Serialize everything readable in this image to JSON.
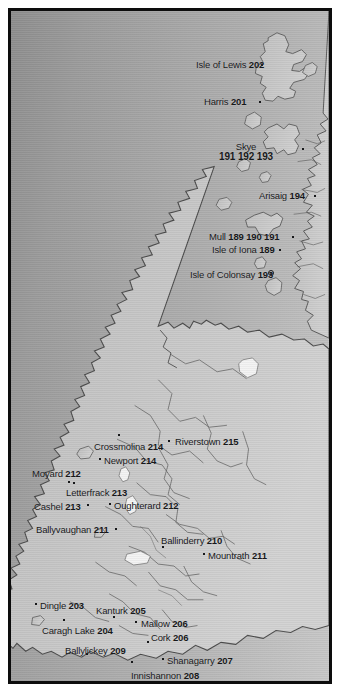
{
  "figure": {
    "kind": "reference-map",
    "region": "Ireland and western Scotland",
    "frame_color": "#0d0d0d",
    "sea_color": "#a6a6a6",
    "land_color": "#c4c4c4",
    "coast_line_color": "#4a4a4a",
    "label_color": "#17181a",
    "water_inland_color": "#f2f2f2"
  },
  "labels": [
    {
      "name": "Isle of Lewis",
      "code": "202",
      "x": 188,
      "y": 52,
      "anchor": "right",
      "marker": "dot",
      "marker_x": 254,
      "marker_y": 57
    },
    {
      "name": "Harris",
      "code": "201",
      "x": 196,
      "y": 89,
      "anchor": "right",
      "marker": "dot",
      "marker_x": 252,
      "marker_y": 94
    },
    {
      "name": "Skye",
      "code": "191 192 193",
      "x": 238,
      "y": 134,
      "anchor": "center",
      "two_line": true,
      "marker": "dot",
      "marker_x": 295,
      "marker_y": 141
    },
    {
      "name": "Arisaig",
      "code": "194",
      "x": 251,
      "y": 183,
      "anchor": "right",
      "marker": "dot",
      "marker_x": 307,
      "marker_y": 188
    },
    {
      "name": "Mull",
      "code": "189 190 191",
      "x": 201,
      "y": 224,
      "anchor": "right",
      "marker": "dot",
      "marker_x": 285,
      "marker_y": 229
    },
    {
      "name": "Isle of Iona",
      "code": "189",
      "x": 204,
      "y": 237,
      "anchor": "right",
      "marker": "dot",
      "marker_x": 272,
      "marker_y": 242
    },
    {
      "name": "Isle of Colonsay",
      "code": "193",
      "x": 182,
      "y": 262,
      "anchor": "right",
      "marker": "ring",
      "marker_x": 263,
      "marker_y": 265
    },
    {
      "name": "Crossmolina",
      "code": "214",
      "x": 86,
      "y": 434,
      "anchor": "left",
      "marker": "dot",
      "marker_x": 111,
      "marker_y": 427
    },
    {
      "name": "Riverstown",
      "code": "215",
      "x": 167,
      "y": 429,
      "anchor": "left",
      "marker": "dot",
      "marker_x": 161,
      "marker_y": 433
    },
    {
      "name": "Newport",
      "code": "214",
      "x": 96,
      "y": 448,
      "anchor": "left",
      "marker": "dot",
      "marker_x": 92,
      "marker_y": 451
    },
    {
      "name": "Moyard",
      "code": "212",
      "x": 24,
      "y": 461,
      "anchor": "left",
      "marker": "dot",
      "marker_x": 66,
      "marker_y": 475
    },
    {
      "name": "Letterfrack",
      "code": "213",
      "x": 58,
      "y": 480,
      "anchor": "left",
      "marker": "dot",
      "marker_x": 61,
      "marker_y": 474
    },
    {
      "name": "Cashel",
      "code": "213",
      "x": 26,
      "y": 494,
      "anchor": "left",
      "marker": "dot",
      "marker_x": 80,
      "marker_y": 497
    },
    {
      "name": "Oughterard",
      "code": "212",
      "x": 106,
      "y": 493,
      "anchor": "left",
      "marker": "dot",
      "marker_x": 102,
      "marker_y": 496
    },
    {
      "name": "Ballyvaughan",
      "code": "211",
      "x": 28,
      "y": 517,
      "anchor": "left",
      "marker": "dot",
      "marker_x": 108,
      "marker_y": 521
    },
    {
      "name": "Ballinderry",
      "code": "210",
      "x": 153,
      "y": 528,
      "anchor": "left",
      "marker": "dot",
      "marker_x": 155,
      "marker_y": 539
    },
    {
      "name": "Mountrath",
      "code": "211",
      "x": 200,
      "y": 543,
      "anchor": "left",
      "marker": "dot",
      "marker_x": 196,
      "marker_y": 546
    },
    {
      "name": "Dingle",
      "code": "203",
      "x": 32,
      "y": 593,
      "anchor": "left",
      "marker": "dot",
      "marker_x": 28,
      "marker_y": 596
    },
    {
      "name": "Kanturk",
      "code": "205",
      "x": 88,
      "y": 598,
      "anchor": "left",
      "marker": "dot",
      "marker_x": 106,
      "marker_y": 609
    },
    {
      "name": "Mallow",
      "code": "206",
      "x": 133,
      "y": 611,
      "anchor": "left",
      "marker": "dot",
      "marker_x": 128,
      "marker_y": 614
    },
    {
      "name": "Caragh Lake",
      "code": "204",
      "x": 34,
      "y": 618,
      "anchor": "left",
      "marker": "dot",
      "marker_x": 56,
      "marker_y": 612
    },
    {
      "name": "Cork",
      "code": "206",
      "x": 143,
      "y": 625,
      "anchor": "left",
      "marker": "dot",
      "marker_x": 140,
      "marker_y": 634
    },
    {
      "name": "Ballylickey",
      "code": "209",
      "x": 57,
      "y": 638,
      "anchor": "left",
      "marker": "dot",
      "marker_x": 79,
      "marker_y": 646
    },
    {
      "name": "Shanagarry",
      "code": "207",
      "x": 159,
      "y": 648,
      "anchor": "left",
      "marker": "dot",
      "marker_x": 155,
      "marker_y": 651
    },
    {
      "name": "Innishannon",
      "code": "208",
      "x": 123,
      "y": 663,
      "anchor": "left",
      "marker": "dot",
      "marker_x": 124,
      "marker_y": 654
    }
  ]
}
